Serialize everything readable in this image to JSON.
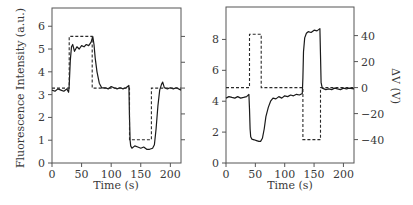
{
  "chart_data": [
    {
      "type": "line",
      "panel": "left",
      "title": "",
      "xlabel": "Time (s)",
      "ylabel": "Fluorescence Intensity (a.u.)",
      "y2label": "",
      "xlim": [
        0,
        218
      ],
      "ylim": [
        0,
        6.8
      ],
      "y2lim": [
        -58,
        62
      ],
      "xticks": [
        0,
        50,
        100,
        150,
        200
      ],
      "yticks": [
        0,
        1,
        2,
        3,
        4,
        5,
        6
      ],
      "y2ticks": [
        -40,
        -20,
        0,
        20,
        40
      ],
      "y2tick_labels_visible": false,
      "grid": false,
      "series": [
        {
          "name": "Fluorescence Intensity",
          "axis": "left",
          "style": "solid",
          "x": [
            0,
            5,
            10,
            15,
            20,
            25,
            28,
            29,
            31,
            33,
            35,
            38,
            42,
            46,
            50,
            54,
            58,
            62,
            66,
            69,
            71,
            73,
            76,
            80,
            84,
            90,
            95,
            100,
            105,
            110,
            115,
            120,
            125,
            130,
            131,
            132,
            133,
            135,
            140,
            145,
            150,
            155,
            160,
            165,
            170,
            173,
            176,
            179,
            182,
            185,
            187,
            190,
            195,
            200,
            205,
            210,
            218
          ],
          "y": [
            3.2,
            3.15,
            3.25,
            3.2,
            3.15,
            3.25,
            3.1,
            3.4,
            4.5,
            5.1,
            5.2,
            4.9,
            5.1,
            5.0,
            5.15,
            5.1,
            5.2,
            5.15,
            5.3,
            5.55,
            5.2,
            4.6,
            4.0,
            3.5,
            3.3,
            3.3,
            3.25,
            3.35,
            3.3,
            3.25,
            3.3,
            3.25,
            3.3,
            3.4,
            2.0,
            1.0,
            0.75,
            0.65,
            0.75,
            0.7,
            0.65,
            0.7,
            0.6,
            0.6,
            0.65,
            0.8,
            1.5,
            2.5,
            3.2,
            3.45,
            3.55,
            3.3,
            3.25,
            3.3,
            3.25,
            3.3,
            3.2
          ]
        },
        {
          "name": "ΔV",
          "axis": "right",
          "style": "dashed",
          "x": [
            0,
            29,
            29,
            68,
            68,
            131,
            131,
            168,
            168,
            218
          ],
          "y": [
            0,
            0,
            40,
            40,
            0,
            0,
            -40,
            -40,
            0,
            0
          ]
        }
      ]
    },
    {
      "type": "line",
      "panel": "right",
      "title": "",
      "xlabel": "Time (s)",
      "ylabel": "",
      "y2label": "ΔV (V)",
      "xlim": [
        0,
        218
      ],
      "ylim": [
        0,
        10.1
      ],
      "y2lim": [
        -58,
        62
      ],
      "xticks": [
        0,
        50,
        100,
        150,
        200
      ],
      "yticks": [
        0,
        2,
        4,
        6,
        8
      ],
      "y2ticks": [
        -40,
        -20,
        0,
        20,
        40
      ],
      "y2tick_labels_visible": true,
      "grid": false,
      "series": [
        {
          "name": "Fluorescence Intensity",
          "axis": "left",
          "style": "solid",
          "x": [
            0,
            5,
            10,
            15,
            20,
            25,
            30,
            35,
            39,
            40,
            41,
            42,
            44,
            48,
            52,
            56,
            59,
            62,
            65,
            68,
            72,
            76,
            80,
            85,
            90,
            95,
            100,
            105,
            110,
            115,
            120,
            125,
            130,
            131,
            132,
            134,
            137,
            140,
            145,
            150,
            155,
            160,
            161,
            162,
            164,
            170,
            175,
            180,
            185,
            190,
            195,
            200,
            205,
            210,
            218
          ],
          "y": [
            4.2,
            4.3,
            4.25,
            4.2,
            4.3,
            4.2,
            4.25,
            4.3,
            4.45,
            3.5,
            2.2,
            1.7,
            1.55,
            1.5,
            1.45,
            1.4,
            1.4,
            1.6,
            2.2,
            3.0,
            3.6,
            4.0,
            4.2,
            4.15,
            4.3,
            4.2,
            4.35,
            4.3,
            4.4,
            4.35,
            4.45,
            4.4,
            4.5,
            5.5,
            7.2,
            8.1,
            8.4,
            8.5,
            8.45,
            8.6,
            8.55,
            8.7,
            7.0,
            5.2,
            4.85,
            4.75,
            4.8,
            4.75,
            4.85,
            4.8,
            4.75,
            4.85,
            4.8,
            4.85,
            4.8
          ]
        },
        {
          "name": "ΔV",
          "axis": "right",
          "style": "dashed",
          "x": [
            0,
            40,
            40,
            60,
            60,
            131,
            131,
            161,
            161,
            218
          ],
          "y": [
            0,
            0,
            41,
            41,
            0,
            0,
            -40,
            -40,
            0,
            0
          ]
        }
      ]
    }
  ],
  "panels": {
    "left": {
      "xlabel": "Time (s)",
      "ylabel": "Fluorescence Intensity (a.u.)",
      "xtick_labels": [
        "0",
        "50",
        "100",
        "150",
        "200"
      ],
      "ytick_labels": [
        "0",
        "1",
        "2",
        "3",
        "4",
        "5",
        "6"
      ]
    },
    "right": {
      "xlabel": "Time (s)",
      "y2label": "ΔV (V)",
      "xtick_labels": [
        "0",
        "50",
        "100",
        "150",
        "200"
      ],
      "ytick_labels": [
        "0",
        "2",
        "4",
        "6",
        "8"
      ],
      "y2tick_labels": [
        "−40",
        "−20",
        "0",
        "20",
        "40"
      ]
    }
  },
  "colors": {
    "line": "#1a1a1a",
    "axis": "#555555",
    "text": "#3a3a3a",
    "background": "#ffffff"
  }
}
